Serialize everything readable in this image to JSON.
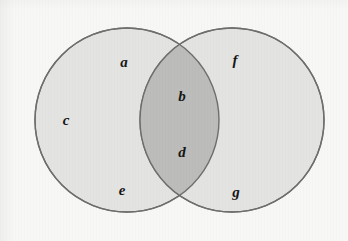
{
  "figure": {
    "type": "venn-diagram",
    "set_count": 2,
    "background_color": "#f7f7f6",
    "stroke_color": "#6e6e6e",
    "left_circle": {
      "name": "left-set",
      "fill_color": "#e3e3e1",
      "cx": 127,
      "cy": 120,
      "r": 92
    },
    "right_circle": {
      "name": "right-set",
      "fill_color": "#e3e3e1",
      "cx": 232,
      "cy": 120,
      "r": 92
    },
    "intersection": {
      "name": "intersection-lens",
      "fill_color": "#bcbcba"
    },
    "labels": [
      {
        "id": "label-a",
        "text": "a",
        "region": "left-only",
        "x": 124,
        "y": 62
      },
      {
        "id": "label-b",
        "text": "b",
        "region": "intersection",
        "x": 182,
        "y": 96
      },
      {
        "id": "label-c",
        "text": "c",
        "region": "left-only",
        "x": 66,
        "y": 120
      },
      {
        "id": "label-d",
        "text": "d",
        "region": "intersection",
        "x": 182,
        "y": 152
      },
      {
        "id": "label-e",
        "text": "e",
        "region": "left-only",
        "x": 122,
        "y": 190
      },
      {
        "id": "label-f",
        "text": "f",
        "region": "right-only",
        "x": 235,
        "y": 60
      },
      {
        "id": "label-g",
        "text": "g",
        "region": "right-only",
        "x": 236,
        "y": 192
      }
    ]
  }
}
